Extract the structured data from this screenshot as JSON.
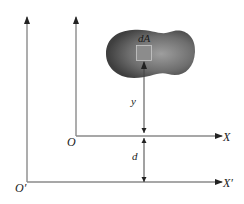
{
  "diagram": {
    "labels": {
      "origin_inner": "O",
      "origin_outer": "O′",
      "axis_x": "X",
      "axis_x_prime": "X′",
      "area_element": "dA",
      "distance_y": "y",
      "distance_d": "d"
    },
    "colors": {
      "axis": "#8a8a8a",
      "arrow": "#222222",
      "shape_dark": "#4a4a4a",
      "shape_light": "#9a9a9a",
      "element_fill": "#8c8c8c",
      "element_stroke": "#c9c9c9",
      "dimension_line": "#444444"
    }
  }
}
